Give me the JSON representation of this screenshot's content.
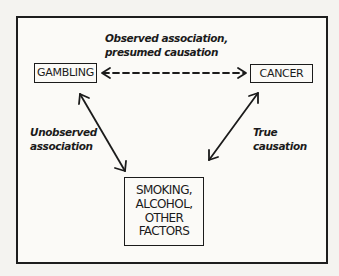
{
  "diagram": {
    "type": "causal-diagram",
    "nodes": [
      {
        "id": "gambling",
        "label": "GAMBLING"
      },
      {
        "id": "cancer",
        "label": "CANCER"
      },
      {
        "id": "factors",
        "label_lines": [
          "SMOKING,",
          "ALCOHOL,",
          "OTHER",
          "FACTORS"
        ]
      }
    ],
    "edges": [
      {
        "from": "gambling",
        "to": "cancer",
        "style": "dashed",
        "direction": "both",
        "label_lines": [
          "Observed association,",
          "presumed causation"
        ]
      },
      {
        "from": "gambling",
        "to": "factors",
        "style": "solid",
        "direction": "both",
        "label_lines": [
          "Unobserved",
          "association"
        ]
      },
      {
        "from": "cancer",
        "to": "factors",
        "style": "solid",
        "direction": "both",
        "label_lines": [
          "True",
          "causation"
        ]
      }
    ]
  },
  "colors": {
    "ink": "#1b1b1b",
    "paper": "#fbfaf7",
    "background": "#f4f3f0"
  }
}
